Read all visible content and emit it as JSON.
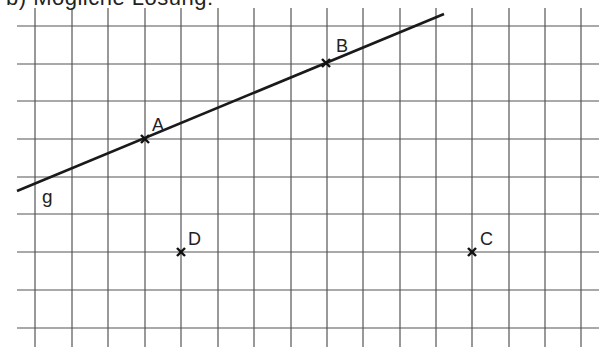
{
  "heading": "b)  Mögliche Lösung:",
  "grid": {
    "vertical_x": [
      35,
      72,
      108,
      145,
      181,
      218,
      254,
      291,
      327,
      363,
      400,
      436,
      472,
      509,
      545,
      581
    ],
    "horizontal_y": [
      26,
      64,
      101,
      139,
      177,
      214,
      252,
      290,
      328
    ],
    "x_start": 17,
    "x_end": 599,
    "y_start": 8,
    "y_end": 347,
    "line_color": "#555555"
  },
  "line_g": {
    "label": "g",
    "x1": 17,
    "y1": 191,
    "x2": 444,
    "y2": 14,
    "color": "#1a1a1a",
    "label_pos": {
      "x": 42,
      "y": 203
    }
  },
  "points": [
    {
      "name": "A",
      "x": 145,
      "y": 139,
      "label_x": 152,
      "label_y": 131
    },
    {
      "name": "B",
      "x": 326,
      "y": 63,
      "label_x": 336,
      "label_y": 52
    },
    {
      "name": "C",
      "x": 472,
      "y": 252,
      "label_x": 480,
      "label_y": 245
    },
    {
      "name": "D",
      "x": 181,
      "y": 252,
      "label_x": 188,
      "label_y": 245
    }
  ]
}
